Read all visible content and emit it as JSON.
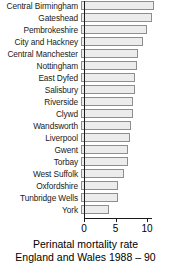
{
  "chart_data": {
    "type": "bar",
    "orientation": "horizontal",
    "title": "",
    "xlabel": "Perinatal mortality rate",
    "ylabel": "",
    "xlim": [
      0,
      11.9
    ],
    "xticks": [
      0,
      5,
      10
    ],
    "xtick_labels": [
      "0",
      "5",
      "10"
    ],
    "grid": false,
    "legend": null,
    "categories": [
      "Central Birmingham",
      "Gateshead",
      "Pembrokeshire",
      "City and Hackney",
      "Central Manchester",
      "Nottingham",
      "East Dyfed",
      "Salisbury",
      "Riverside",
      "Clywd",
      "Wandsworth",
      "Liverpool",
      "Gwent",
      "Torbay",
      "West Suffolk",
      "Oxfordshire",
      "Tunbridge Wells",
      "York"
    ],
    "values": [
      11.6,
      11.2,
      10.4,
      9.8,
      9.0,
      8.9,
      8.6,
      8.5,
      8.3,
      8.2,
      8.0,
      7.7,
      7.4,
      7.4,
      6.8,
      5.9,
      5.9,
      4.5
    ]
  },
  "caption": {
    "line1": "Perinatal mortality rate",
    "line2": "England and Wales 1988 – 90"
  },
  "colors": {
    "bar_fill": "#ececec",
    "bar_border": "#8e8e8e",
    "axis": "#1a1a1a",
    "text": "#000000",
    "background": "#ffffff"
  }
}
